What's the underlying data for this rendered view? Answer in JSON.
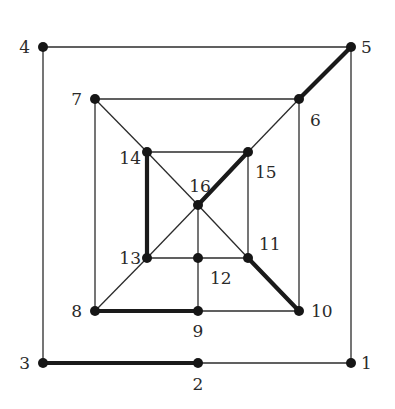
{
  "diagram": {
    "type": "graph",
    "nodes": [
      {
        "id": "1",
        "x": 351,
        "y": 363,
        "label": "1",
        "lx": 361,
        "ly": 369,
        "anchor": "start"
      },
      {
        "id": "2",
        "x": 198,
        "y": 363,
        "label": "2",
        "lx": 198,
        "ly": 390,
        "anchor": "middle"
      },
      {
        "id": "3",
        "x": 43,
        "y": 363,
        "label": "3",
        "lx": 30,
        "ly": 369,
        "anchor": "end"
      },
      {
        "id": "4",
        "x": 43,
        "y": 47,
        "label": "4",
        "lx": 30,
        "ly": 53,
        "anchor": "end"
      },
      {
        "id": "5",
        "x": 351,
        "y": 47,
        "label": "5",
        "lx": 361,
        "ly": 53,
        "anchor": "start"
      },
      {
        "id": "6",
        "x": 299,
        "y": 99,
        "label": "6",
        "lx": 310,
        "ly": 126,
        "anchor": "start"
      },
      {
        "id": "7",
        "x": 95,
        "y": 99,
        "label": "7",
        "lx": 82,
        "ly": 105,
        "anchor": "end"
      },
      {
        "id": "8",
        "x": 95,
        "y": 311,
        "label": "8",
        "lx": 82,
        "ly": 317,
        "anchor": "end"
      },
      {
        "id": "9",
        "x": 198,
        "y": 311,
        "label": "9",
        "lx": 198,
        "ly": 337,
        "anchor": "middle"
      },
      {
        "id": "10",
        "x": 299,
        "y": 311,
        "label": "10",
        "lx": 311,
        "ly": 317,
        "anchor": "start"
      },
      {
        "id": "11",
        "x": 248,
        "y": 258,
        "label": "11",
        "lx": 259,
        "ly": 250,
        "anchor": "start"
      },
      {
        "id": "12",
        "x": 198,
        "y": 258,
        "label": "12",
        "lx": 210,
        "ly": 284,
        "anchor": "start"
      },
      {
        "id": "13",
        "x": 147,
        "y": 258,
        "label": "13",
        "lx": 141,
        "ly": 264,
        "anchor": "end"
      },
      {
        "id": "14",
        "x": 147,
        "y": 152,
        "label": "14",
        "lx": 141,
        "ly": 164,
        "anchor": "end"
      },
      {
        "id": "15",
        "x": 248,
        "y": 152,
        "label": "15",
        "lx": 255,
        "ly": 178,
        "anchor": "start"
      },
      {
        "id": "16",
        "x": 198,
        "y": 205,
        "label": "16",
        "lx": 200,
        "ly": 192,
        "anchor": "middle"
      }
    ],
    "edges": [
      {
        "from": "4",
        "to": "5",
        "thick": false
      },
      {
        "from": "5",
        "to": "1",
        "thick": false
      },
      {
        "from": "1",
        "to": "2",
        "thick": false
      },
      {
        "from": "2",
        "to": "3",
        "thick": true
      },
      {
        "from": "3",
        "to": "4",
        "thick": false
      },
      {
        "from": "5",
        "to": "6",
        "thick": true
      },
      {
        "from": "7",
        "to": "6",
        "thick": false
      },
      {
        "from": "6",
        "to": "10",
        "thick": false
      },
      {
        "from": "10",
        "to": "9",
        "thick": false
      },
      {
        "from": "9",
        "to": "8",
        "thick": true
      },
      {
        "from": "8",
        "to": "7",
        "thick": false
      },
      {
        "from": "6",
        "to": "15",
        "thick": false
      },
      {
        "from": "7",
        "to": "14",
        "thick": false
      },
      {
        "from": "8",
        "to": "13",
        "thick": false
      },
      {
        "from": "10",
        "to": "11",
        "thick": true
      },
      {
        "from": "14",
        "to": "15",
        "thick": false
      },
      {
        "from": "15",
        "to": "11",
        "thick": false
      },
      {
        "from": "11",
        "to": "12",
        "thick": false
      },
      {
        "from": "12",
        "to": "13",
        "thick": false
      },
      {
        "from": "13",
        "to": "14",
        "thick": true
      },
      {
        "from": "14",
        "to": "16",
        "thick": false
      },
      {
        "from": "16",
        "to": "15",
        "thick": true
      },
      {
        "from": "13",
        "to": "16",
        "thick": false
      },
      {
        "from": "16",
        "to": "11",
        "thick": false
      },
      {
        "from": "16",
        "to": "12",
        "thick": false
      },
      {
        "from": "12",
        "to": "9",
        "thick": false
      }
    ],
    "colors": {
      "edge": "#2b2b2b",
      "thick_edge": "#1a1a1a",
      "node": "#161616",
      "label": "#2a2a2a",
      "background": "#ffffff"
    }
  }
}
